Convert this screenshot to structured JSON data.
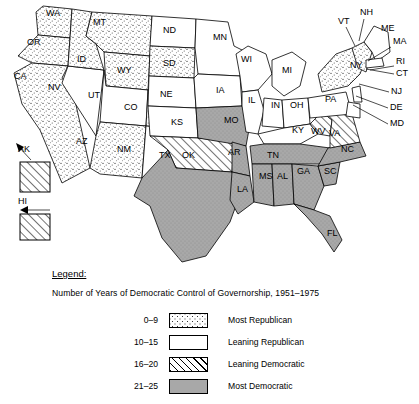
{
  "map": {
    "title": "United States map of Democratic control of governorship 1951-1975",
    "states": [
      {
        "code": "WA",
        "name": "Washington",
        "category": "most_republican",
        "label_x": 46,
        "label_y": 16
      },
      {
        "code": "OR",
        "name": "Oregon",
        "category": "most_republican",
        "label_x": 27,
        "label_y": 45
      },
      {
        "code": "CA",
        "name": "California",
        "category": "most_republican",
        "label_x": 14,
        "label_y": 79
      },
      {
        "code": "NV",
        "name": "Nevada",
        "category": "leaning_republican",
        "label_x": 48,
        "label_y": 90
      },
      {
        "code": "ID",
        "name": "Idaho",
        "category": "most_republican",
        "label_x": 77,
        "label_y": 62
      },
      {
        "code": "MT",
        "name": "Montana",
        "category": "most_republican",
        "label_x": 93,
        "label_y": 25
      },
      {
        "code": "WY",
        "name": "Wyoming",
        "category": "most_republican",
        "label_x": 117,
        "label_y": 73
      },
      {
        "code": "UT",
        "name": "Utah",
        "category": "leaning_republican",
        "label_x": 88,
        "label_y": 98
      },
      {
        "code": "AZ",
        "name": "Arizona",
        "category": "most_republican",
        "label_x": 76,
        "label_y": 144
      },
      {
        "code": "CO",
        "name": "Colorado",
        "category": "most_republican",
        "label_x": 124,
        "label_y": 110
      },
      {
        "code": "NM",
        "name": "New Mexico",
        "category": "leaning_republican",
        "label_x": 117,
        "label_y": 152
      },
      {
        "code": "ND",
        "name": "North Dakota",
        "category": "leaning_republican",
        "label_x": 163,
        "label_y": 33
      },
      {
        "code": "SD",
        "name": "South Dakota",
        "category": "most_republican",
        "label_x": 163,
        "label_y": 66
      },
      {
        "code": "NE",
        "name": "Nebraska",
        "category": "leaning_republican",
        "label_x": 160,
        "label_y": 97
      },
      {
        "code": "KS",
        "name": "Kansas",
        "category": "leaning_republican",
        "label_x": 171,
        "label_y": 125
      },
      {
        "code": "OK",
        "name": "Oklahoma",
        "category": "leaning_democratic",
        "label_x": 182,
        "label_y": 158
      },
      {
        "code": "TX",
        "name": "Texas",
        "category": "most_democratic",
        "label_x": 159,
        "label_y": 158
      },
      {
        "code": "MN",
        "name": "Minnesota",
        "category": "leaning_republican",
        "label_x": 213,
        "label_y": 40
      },
      {
        "code": "IA",
        "name": "Iowa",
        "category": "leaning_republican",
        "label_x": 216,
        "label_y": 93
      },
      {
        "code": "MO",
        "name": "Missouri",
        "category": "most_democratic",
        "label_x": 224,
        "label_y": 123
      },
      {
        "code": "AR",
        "name": "Arkansas",
        "category": "most_democratic",
        "label_x": 228,
        "label_y": 155
      },
      {
        "code": "LA",
        "name": "Louisiana",
        "category": "most_democratic",
        "label_x": 237,
        "label_y": 192
      },
      {
        "code": "WI",
        "name": "Wisconsin",
        "category": "leaning_republican",
        "label_x": 241,
        "label_y": 62
      },
      {
        "code": "IL",
        "name": "Illinois",
        "category": "leaning_republican",
        "label_x": 248,
        "label_y": 103
      },
      {
        "code": "MS",
        "name": "Mississippi",
        "category": "most_democratic",
        "label_x": 259,
        "label_y": 179
      },
      {
        "code": "MI",
        "name": "Michigan",
        "category": "leaning_republican",
        "label_x": 282,
        "label_y": 73
      },
      {
        "code": "IN",
        "name": "Indiana",
        "category": "leaning_republican",
        "label_x": 271,
        "label_y": 108
      },
      {
        "code": "TN",
        "name": "Tennessee",
        "category": "most_democratic",
        "label_x": 267,
        "label_y": 158
      },
      {
        "code": "AL",
        "name": "Alabama",
        "category": "most_democratic",
        "label_x": 277,
        "label_y": 179
      },
      {
        "code": "OH",
        "name": "Ohio",
        "category": "leaning_republican",
        "label_x": 290,
        "label_y": 108
      },
      {
        "code": "KY",
        "name": "Kentucky",
        "category": "leaning_republican",
        "label_x": 292,
        "label_y": 133
      },
      {
        "code": "GA",
        "name": "Georgia",
        "category": "most_democratic",
        "label_x": 297,
        "label_y": 174
      },
      {
        "code": "FL",
        "name": "Florida",
        "category": "most_democratic",
        "label_x": 327,
        "label_y": 236
      },
      {
        "code": "WV",
        "name": "West Virginia",
        "category": "leaning_democratic",
        "label_x": 311,
        "label_y": 134
      },
      {
        "code": "SC",
        "name": "South Carolina",
        "category": "most_democratic",
        "label_x": 324,
        "label_y": 174
      },
      {
        "code": "NC",
        "name": "North Carolina",
        "category": "most_democratic",
        "label_x": 341,
        "label_y": 152
      },
      {
        "code": "VA",
        "name": "Virginia",
        "category": "leaning_democratic",
        "label_x": 329,
        "label_y": 136
      },
      {
        "code": "PA",
        "name": "Pennsylvania",
        "category": "leaning_republican",
        "label_x": 325,
        "label_y": 102
      },
      {
        "code": "NY",
        "name": "New York",
        "category": "most_republican",
        "label_x": 350,
        "label_y": 68
      }
    ],
    "callouts": [
      {
        "code": "NH",
        "name": "New Hampshire",
        "category": "most_republican",
        "label_x": 360,
        "label_y": 15,
        "lx1": 364,
        "ly1": 19,
        "lx2": 359,
        "ly2": 41
      },
      {
        "code": "VT",
        "name": "Vermont",
        "category": "most_republican",
        "label_x": 338,
        "label_y": 24,
        "lx1": 346,
        "ly1": 27,
        "lx2": 355,
        "ly2": 46
      },
      {
        "code": "ME",
        "name": "Maine",
        "category": "leaning_republican",
        "label_x": 381,
        "label_y": 31,
        "lx1": 0,
        "ly1": 0,
        "lx2": 0,
        "ly2": 0
      },
      {
        "code": "MA",
        "name": "Massachusetts",
        "category": "leaning_republican",
        "label_x": 393,
        "label_y": 44,
        "lx1": 391,
        "ly1": 47,
        "lx2": 368,
        "ly2": 61
      },
      {
        "code": "RI",
        "name": "Rhode Island",
        "category": "leaning_republican",
        "label_x": 396,
        "label_y": 64,
        "lx1": 394,
        "ly1": 66,
        "lx2": 370,
        "ly2": 70
      },
      {
        "code": "CT",
        "name": "Connecticut",
        "category": "leaning_republican",
        "label_x": 396,
        "label_y": 76,
        "lx1": 394,
        "ly1": 74,
        "lx2": 366,
        "ly2": 69
      },
      {
        "code": "NJ",
        "name": "New Jersey",
        "category": "leaning_republican",
        "label_x": 391,
        "label_y": 94,
        "lx1": 389,
        "ly1": 92,
        "lx2": 359,
        "ly2": 84
      },
      {
        "code": "DE",
        "name": "Delaware",
        "category": "leaning_republican",
        "label_x": 390,
        "label_y": 110,
        "lx1": 388,
        "ly1": 108,
        "lx2": 356,
        "ly2": 96
      },
      {
        "code": "MD",
        "name": "Maryland",
        "category": "leaning_republican",
        "label_x": 390,
        "label_y": 126,
        "lx1": 388,
        "ly1": 124,
        "lx2": 353,
        "ly2": 105
      },
      {
        "code": "AK",
        "name": "Alaska",
        "category": "leaning_democratic",
        "label_x": 18,
        "label_y": 152,
        "lx1": 0,
        "ly1": 0,
        "lx2": 0,
        "ly2": 0
      },
      {
        "code": "HI",
        "name": "Hawaii",
        "category": "leaning_democratic",
        "label_x": 18,
        "label_y": 204,
        "lx1": 0,
        "ly1": 0,
        "lx2": 0,
        "ly2": 0
      }
    ]
  },
  "legend": {
    "heading": "Legend:",
    "subtitle": "Number of Years of Democratic Control of Governorship, 1951–1975",
    "rows": [
      {
        "range": "0–9",
        "label": "Most Republican",
        "pattern": "stipple",
        "key": "most_republican"
      },
      {
        "range": "10–15",
        "label": "Leaning Republican",
        "pattern": "solid-white",
        "key": "leaning_republican"
      },
      {
        "range": "16–20",
        "label": "Leaning Democratic",
        "pattern": "hatch",
        "key": "leaning_democratic"
      },
      {
        "range": "21–25",
        "label": "Most Democratic",
        "pattern": "gray",
        "key": "most_democratic"
      }
    ]
  },
  "colors": {
    "gray_fill": "#a8a8a8",
    "line": "#000000",
    "white_fill": "#ffffff"
  }
}
